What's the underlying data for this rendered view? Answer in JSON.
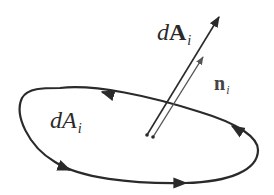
{
  "figure": {
    "labels": {
      "area_vector": {
        "prefix": "d",
        "symbol": "A",
        "subscript": "i"
      },
      "unit_normal": {
        "symbol": "n",
        "subscript": "i"
      },
      "area_scalar": {
        "prefix": "d",
        "symbol": "A",
        "subscript": "i"
      }
    },
    "loop_orientation": "counter-clockwise",
    "arrows_on_loop": [
      "top-left (pointing left)",
      "left-bottom (pointing right)",
      "bottom (pointing right)",
      "right (pointing up)"
    ],
    "colors": {
      "ink": "#2a2a2a",
      "normal_ink": "#555555"
    }
  }
}
